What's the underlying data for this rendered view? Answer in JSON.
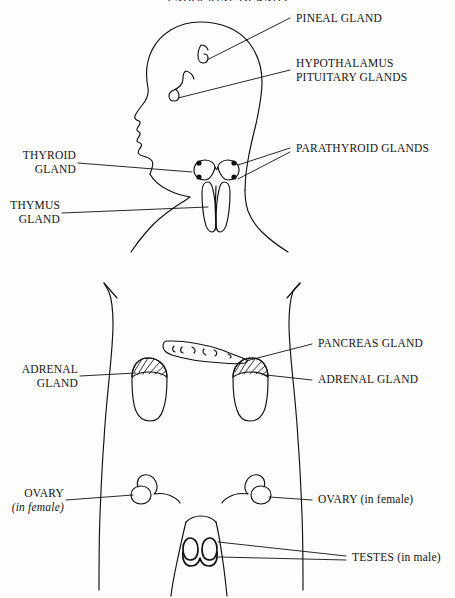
{
  "figure": {
    "title": "ENDOCRINE GLANDS",
    "ink_color": "#111111",
    "paper_color": "#fdfdfc",
    "labels": {
      "pineal": "PINEAL GLAND",
      "hypothalamus": "HYPOTHALAMUS",
      "pituitary": "PITUITARY GLANDS",
      "parathyroid": "PARATHYROID GLANDS",
      "thyroid_line1": "THYROID",
      "thyroid_line2": "GLAND",
      "thymus_line1": "THYMUS",
      "thymus_line2": "GLAND",
      "pancreas": "PANCREAS GLAND",
      "adrenal_left_line1": "ADRENAL",
      "adrenal_left_line2": "GLAND",
      "adrenal_right": "ADRENAL GLAND",
      "ovary_left_line1": "OVARY",
      "ovary_left_line2": "(in female)",
      "ovary_right": "OVARY (in female)",
      "testes": "TESTES (in male)"
    },
    "parts": [
      "head-profile",
      "brain-pineal-gland",
      "brain-pituitary-gland",
      "thyroid-gland",
      "parathyroid-dots",
      "thymus-gland",
      "torso-outline",
      "pancreas-gland",
      "left-kidney-adrenal",
      "right-kidney-adrenal",
      "left-ovary",
      "right-ovary",
      "testes"
    ]
  }
}
